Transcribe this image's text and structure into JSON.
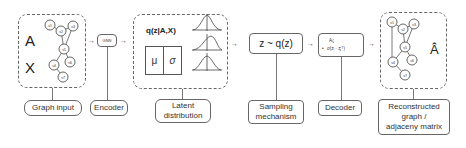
{
  "stages": [
    {
      "id": "graph-input",
      "label": "Graph input",
      "matrix_labels": [
        "A",
        "X"
      ]
    },
    {
      "id": "encoder",
      "label": "Encoder",
      "block": "GNN"
    },
    {
      "id": "latent",
      "label": "Latent distribution",
      "label_lines": [
        "Latent",
        "distribution"
      ],
      "title": "q(z|A,X)",
      "mu": "μ",
      "sigma": "σ"
    },
    {
      "id": "sampling",
      "label": "Sampling mechanism",
      "label_lines": [
        "Sampling",
        "mechanism"
      ],
      "formula": "z ~ q(z)"
    },
    {
      "id": "decoder",
      "label": "Decoder",
      "formula_line1": "Aᵢⱼ",
      "formula_line2": "σ(zᵢ · zⱼᵀ)",
      "bullet": "•"
    },
    {
      "id": "reconstructed",
      "label": "Reconstructed graph / adjacency matrix",
      "label_lines": [
        "Reconstructed",
        "graph  /",
        "adjaceny matrix"
      ],
      "matrix_label": "Â"
    }
  ],
  "arrows": [
    "→",
    "→",
    "→",
    "→",
    "→"
  ],
  "graph_nodes": [
    "v₁",
    "v₂",
    "v₃",
    "v₄",
    "v₅",
    "v₆",
    "v₇"
  ],
  "colors": {
    "stroke": "#666666",
    "text": "#333333",
    "background": "#ffffff"
  }
}
